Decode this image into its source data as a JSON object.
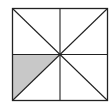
{
  "diagram": {
    "type": "square divided into 8 triangles",
    "square": {
      "x": 12,
      "y": 8,
      "size_w": 96,
      "size_h": 93
    },
    "lines": [
      "vertical-midline",
      "horizontal-midline",
      "diagonal-tl-br",
      "diagonal-bl-tr"
    ],
    "shaded_region": "lower-left triangle left of bl-tr diagonal below horizontal midline",
    "colors": {
      "stroke": "#222222",
      "shade": "#c8c8c8",
      "background": "#ffffff"
    }
  }
}
